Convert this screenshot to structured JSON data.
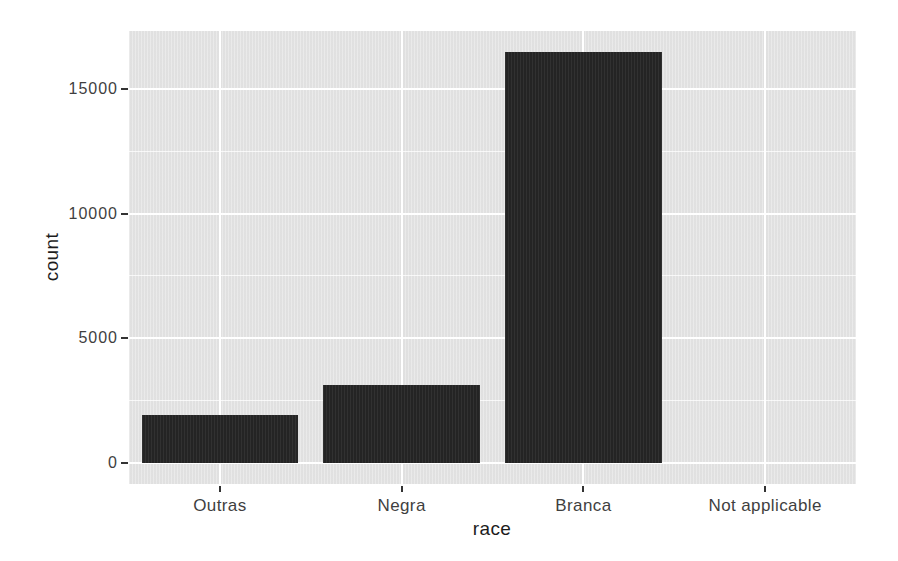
{
  "chart_data": {
    "type": "bar",
    "title": "",
    "xlabel": "race",
    "ylabel": "count",
    "categories": [
      "Outras",
      "Negra",
      "Branca",
      "Not applicable"
    ],
    "values": [
      1920,
      3150,
      16480,
      0
    ],
    "y_ticks": [
      0,
      5000,
      10000,
      15000
    ],
    "y_minor_ticks": [
      2500,
      7500,
      12500
    ],
    "ylim": [
      0,
      17300
    ],
    "grid": "on",
    "legend": "none",
    "bar_width_fraction": 0.86,
    "colors": {
      "bar_fill": "#262626",
      "panel_background": "#e4e4e4",
      "grid_major": "#ffffff",
      "grid_minor": "#ffffff",
      "axis_text": "#3f3f3f",
      "axis_title": "#1c1c1c",
      "tick_mark": "#333333",
      "figure_background": "#ffffff"
    }
  }
}
